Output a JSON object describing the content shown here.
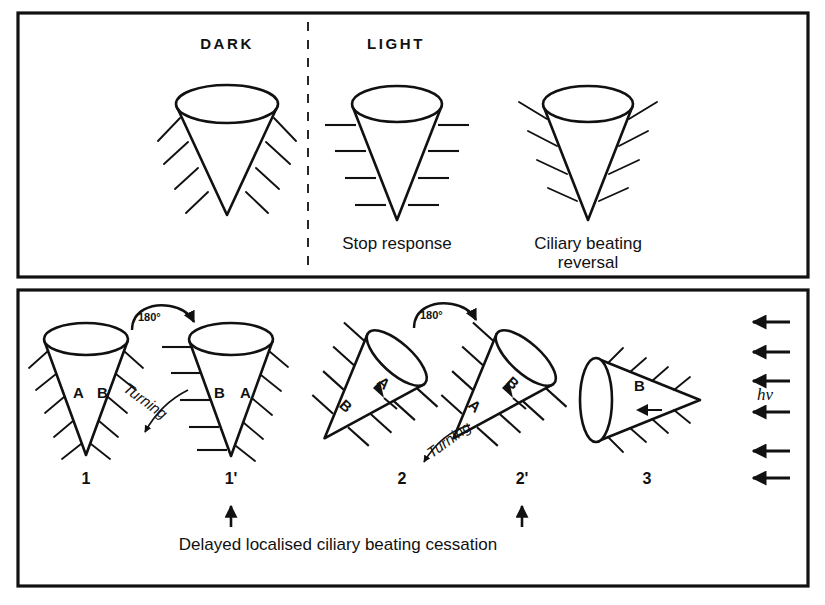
{
  "figure": {
    "stroke_color": "#111111",
    "background": "#ffffff"
  },
  "top_panel": {
    "name": "conditions-panel",
    "divider": "dashed-vertical",
    "headings": [
      {
        "id": "dark",
        "label": "DARK"
      },
      {
        "id": "light",
        "label": "LIGHT"
      }
    ],
    "cells": [
      {
        "id": "dark-cell",
        "orientation": "upright",
        "cilia_style": "swept-back",
        "caption": ""
      },
      {
        "id": "stop-response-cell",
        "orientation": "upright",
        "cilia_style": "horizontal-stopped",
        "caption": "Stop response"
      },
      {
        "id": "reversal-cell",
        "orientation": "upright",
        "cilia_style": "swept-forward",
        "caption_line1": "Ciliary beating",
        "caption_line2": "reversal"
      }
    ]
  },
  "bottom_panel": {
    "name": "turning-sequence-panel",
    "caption": "Delayed localised ciliary beating cessation",
    "rotation_label": "180°",
    "turning_label": "Turning",
    "light_label": "hν",
    "light_arrow_count": 6,
    "light_arrow_direction": "left",
    "cells": [
      {
        "id": "cell-1",
        "number": "1",
        "orientation": "upright",
        "left_label": "A",
        "right_label": "B",
        "cilia_style": "swept-back-both-sides"
      },
      {
        "id": "cell-1-prime",
        "number": "1'",
        "orientation": "upright-rotated-180",
        "left_label": "B",
        "right_label": "A",
        "cilia_style": "left-stopped-right-swept"
      },
      {
        "id": "cell-2",
        "number": "2",
        "orientation": "tilted-45",
        "upper_label": "A",
        "lower_label": "B",
        "cilia_style": "upper-stopped-lower-perpendicular"
      },
      {
        "id": "cell-2-prime",
        "number": "2'",
        "orientation": "tilted-45-rotated",
        "upper_label": "B",
        "lower_label": "A",
        "cilia_style": "upper-stopped-lower-perpendicular"
      },
      {
        "id": "cell-3",
        "number": "3",
        "orientation": "horizontal-pointing-right",
        "upper_label": "B",
        "lower_label": "A",
        "cilia_style": "swept-forward"
      }
    ],
    "cessation_markers": [
      {
        "for": "cell-1-prime",
        "glyph": "↑"
      },
      {
        "for": "cell-2-prime",
        "glyph": "↑"
      }
    ]
  }
}
